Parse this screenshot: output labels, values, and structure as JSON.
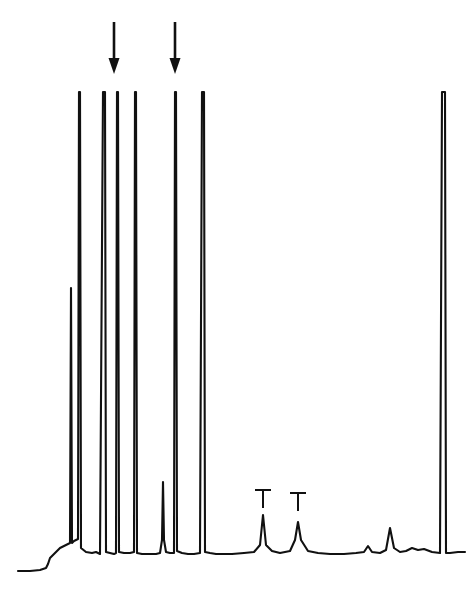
{
  "figure": {
    "title": "",
    "subtitle": "",
    "width": 473,
    "height": 593,
    "background_color": "#ffffff",
    "trace_color": "#111111",
    "annotation_color": "#111111"
  },
  "chart_data": {
    "type": "line",
    "title": "",
    "subtitle": "",
    "xlabel": "",
    "ylabel": "",
    "grid": false,
    "legend": false,
    "axis_visible": false,
    "xlim": [
      0,
      473
    ],
    "ylim_pixels": {
      "baseline_y": 554,
      "top_clip_y": 92,
      "start_y": 571
    },
    "x": [
      18,
      30,
      40,
      46,
      48,
      50,
      56,
      60,
      64,
      66,
      68,
      70,
      71,
      72,
      74,
      76,
      78,
      79,
      80,
      81,
      86,
      92,
      96,
      100,
      103,
      104,
      105,
      106,
      110,
      114,
      116,
      117,
      118,
      119,
      124,
      130,
      134,
      135,
      136,
      137,
      142,
      150,
      156,
      160,
      162,
      163,
      164,
      166,
      170,
      174,
      175,
      176,
      177,
      182,
      188,
      194,
      200,
      202,
      203,
      204,
      205,
      210,
      216,
      222,
      232,
      244,
      254,
      260,
      263,
      266,
      272,
      280,
      290,
      295,
      298,
      301,
      308,
      318,
      330,
      344,
      356,
      364,
      368,
      372,
      380,
      386,
      390,
      394,
      400,
      406,
      412,
      418,
      424,
      432,
      440,
      442,
      443,
      444,
      445,
      446,
      450,
      458,
      465
    ],
    "y": [
      571,
      571,
      570,
      568,
      564,
      558,
      552,
      548,
      546,
      545,
      544,
      543,
      288,
      543,
      541,
      540,
      539,
      92,
      92,
      548,
      552,
      553,
      552,
      554,
      92,
      92,
      92,
      552,
      553,
      554,
      553,
      92,
      92,
      552,
      553,
      553,
      552,
      92,
      92,
      553,
      554,
      554,
      554,
      553,
      540,
      482,
      540,
      552,
      553,
      553,
      92,
      92,
      551,
      553,
      554,
      554,
      553,
      92,
      92,
      92,
      552,
      553,
      554,
      554,
      554,
      553,
      552,
      545,
      515,
      545,
      551,
      553,
      551,
      540,
      522,
      540,
      551,
      553,
      554,
      554,
      553,
      552,
      546,
      552,
      553,
      550,
      528,
      548,
      552,
      551,
      548,
      550,
      549,
      552,
      553,
      92,
      92,
      92,
      92,
      553,
      553,
      552,
      552
    ],
    "peaks": [
      {
        "index": 1,
        "x": 48,
        "apex_y": 230,
        "truncated": false,
        "label": "",
        "relative_height": 0.72
      },
      {
        "index": 2,
        "x": 71,
        "apex_y": 288,
        "truncated": false,
        "label": "",
        "relative_height": 0.57
      },
      {
        "index": 3,
        "x": 80,
        "apex_y": 92,
        "truncated": true,
        "label": "",
        "relative_height": 1.0
      },
      {
        "index": 4,
        "x": 104,
        "apex_y": 92,
        "truncated": true,
        "label": "",
        "relative_height": 1.0
      },
      {
        "index": 5,
        "x": 118,
        "apex_y": 92,
        "truncated": true,
        "label": "",
        "relative_height": 1.0,
        "arrow": true
      },
      {
        "index": 6,
        "x": 136,
        "apex_y": 92,
        "truncated": true,
        "label": "",
        "relative_height": 1.0
      },
      {
        "index": 7,
        "x": 163,
        "apex_y": 482,
        "truncated": false,
        "label": "",
        "relative_height": 0.16
      },
      {
        "index": 8,
        "x": 176,
        "apex_y": 92,
        "truncated": true,
        "label": "",
        "relative_height": 1.0,
        "arrow": true
      },
      {
        "index": 9,
        "x": 203,
        "apex_y": 92,
        "truncated": true,
        "label": "",
        "relative_height": 1.0
      },
      {
        "index": 10,
        "x": 263,
        "apex_y": 515,
        "truncated": false,
        "label": "T",
        "relative_height": 0.085
      },
      {
        "index": 11,
        "x": 298,
        "apex_y": 522,
        "truncated": false,
        "label": "T",
        "relative_height": 0.07
      },
      {
        "index": 12,
        "x": 368,
        "apex_y": 546,
        "truncated": false,
        "label": "",
        "relative_height": 0.017
      },
      {
        "index": 13,
        "x": 390,
        "apex_y": 528,
        "truncated": false,
        "label": "",
        "relative_height": 0.056
      },
      {
        "index": 14,
        "x": 412,
        "apex_y": 548,
        "truncated": false,
        "label": "",
        "relative_height": 0.013
      },
      {
        "index": 15,
        "x": 444,
        "apex_y": 92,
        "truncated": true,
        "label": "",
        "relative_height": 1.0
      }
    ],
    "annotations": {
      "arrows": [
        {
          "name": "arrow-1",
          "label": "",
          "x": 114,
          "y_top": 22,
          "y_tip": 74,
          "direction": "down",
          "points_to_peak": 5
        },
        {
          "name": "arrow-2",
          "label": "",
          "x": 175,
          "y_top": 22,
          "y_tip": 74,
          "direction": "down",
          "points_to_peak": 8
        }
      ],
      "t_marks": [
        {
          "name": "t-mark-1",
          "label": "T",
          "x": 263,
          "y_bar": 490,
          "y_stem_bottom": 508,
          "marks_peak": 10
        },
        {
          "name": "t-mark-2",
          "label": "T",
          "x": 298,
          "y_bar": 493,
          "y_stem_bottom": 511,
          "marks_peak": 11
        }
      ]
    }
  }
}
